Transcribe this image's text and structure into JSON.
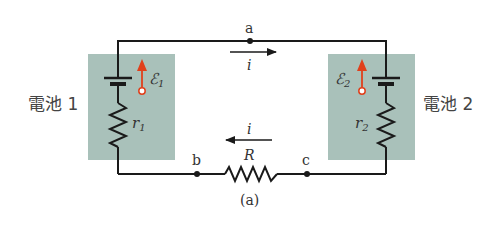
{
  "diagram": {
    "type": "circuit",
    "caption": "(a)",
    "colors": {
      "wire": "#1a1a1a",
      "battery_box": "#a9c1ba",
      "emf_arrow": "#e0401c",
      "text": "#333333"
    },
    "batteries": [
      {
        "label": "電池 1",
        "emf_symbol": "ℰ",
        "emf_subscript": "1",
        "resistance_symbol": "r",
        "resistance_subscript": "1"
      },
      {
        "label": "電池 2",
        "emf_symbol": "ℰ",
        "emf_subscript": "2",
        "resistance_symbol": "r",
        "resistance_subscript": "2"
      }
    ],
    "external_resistor": {
      "symbol": "R"
    },
    "nodes": [
      {
        "label": "a"
      },
      {
        "label": "b"
      },
      {
        "label": "c"
      }
    ],
    "currents": [
      {
        "symbol": "i",
        "direction": "right",
        "position": "top wire"
      },
      {
        "symbol": "i",
        "direction": "left",
        "position": "bottom wire"
      }
    ]
  }
}
